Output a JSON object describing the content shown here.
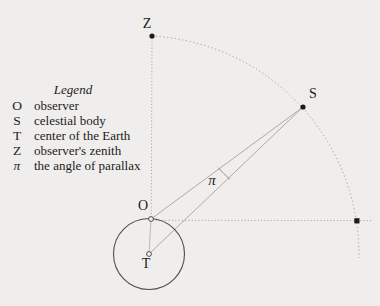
{
  "figure": {
    "background_color": "#efeeec",
    "line_color": "#ababab",
    "dotted_color": "#9b9b9b",
    "earth_outline_color": "#4d4d4d",
    "point_color": "#1c1c1c",
    "labels": {
      "zenith": "Z",
      "celestial_body": "S",
      "observer": "O",
      "earth_center": "T",
      "parallax_angle": "π"
    }
  },
  "legend": {
    "title": "Legend",
    "entries": [
      {
        "symbol": "O",
        "description": "observer"
      },
      {
        "symbol": "S",
        "description": "celestial body"
      },
      {
        "symbol": "T",
        "description": "center of the Earth"
      },
      {
        "symbol": "Z",
        "description": "observer's zenith"
      },
      {
        "symbol": "π",
        "description": "the angle of parallax"
      }
    ]
  }
}
